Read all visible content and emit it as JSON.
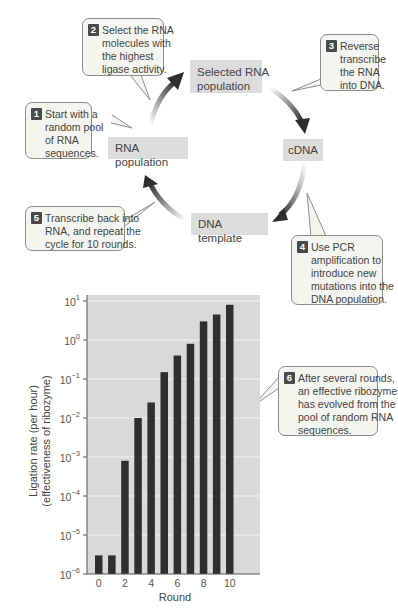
{
  "cycle": {
    "nodes": {
      "rna_population": "RNA population",
      "selected_rna_population": [
        "Selected RNA",
        "population"
      ],
      "cdna": "cDNA",
      "dna_template": "DNA template"
    },
    "steps": [
      {
        "number": "1",
        "lines": [
          "Start with a",
          "random pool",
          "of RNA",
          "sequences."
        ]
      },
      {
        "number": "2",
        "lines": [
          "Select the RNA",
          "molecules with",
          "the highest",
          "ligase activity."
        ]
      },
      {
        "number": "3",
        "lines": [
          "Reverse",
          "transcribe",
          "the RNA",
          "into DNA."
        ]
      },
      {
        "number": "4",
        "lines": [
          "Use PCR",
          "amplification to",
          "introduce new",
          "mutations into the",
          "DNA population."
        ]
      },
      {
        "number": "5",
        "lines": [
          "Transcribe back into",
          "RNA, and repeat the",
          "cycle for 10 rounds."
        ]
      },
      {
        "number": "6",
        "lines": [
          "After several rounds,",
          "an effective ribozyme",
          "has evolved from the",
          "pool of random RNA",
          "sequences."
        ]
      }
    ]
  },
  "chart_data": {
    "type": "bar",
    "title": "",
    "xlabel": "Round",
    "ylabel": "Ligation rate (per hour)",
    "ylabel_sub": "(effectiveness of ribozyme)",
    "yscale": "log",
    "ylim": [
      1e-06,
      10
    ],
    "grid": true,
    "categories": [
      0,
      1,
      2,
      3,
      4,
      5,
      6,
      7,
      8,
      9,
      10
    ],
    "values": [
      3e-06,
      3e-06,
      0.0008,
      0.01,
      0.025,
      0.15,
      0.4,
      0.8,
      3,
      4.5,
      8
    ],
    "x_tick_labels": [
      "0",
      "2",
      "4",
      "6",
      "8",
      "10"
    ],
    "y_tick_labels": [
      {
        "base": "10",
        "exp": "1"
      },
      {
        "base": "10",
        "exp": "0"
      },
      {
        "base": "10",
        "exp": "−1"
      },
      {
        "base": "10",
        "exp": "−2"
      },
      {
        "base": "10",
        "exp": "−3"
      },
      {
        "base": "10",
        "exp": "−4"
      },
      {
        "base": "10",
        "exp": "−5"
      },
      {
        "base": "10",
        "exp": "−6"
      }
    ],
    "colors": {
      "bar": "#2f2f2f",
      "plot_bg": "#d9d9d9",
      "grid": "#f2f2f2"
    }
  }
}
